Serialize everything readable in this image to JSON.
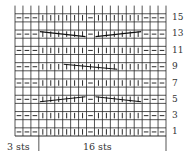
{
  "chart": {
    "columns": 19,
    "rows_shown": 16,
    "symbols": {
      "-": "purl",
      "|": "knit",
      ".": "blank (wrong-side row)"
    },
    "row_patterns": {
      "1": "---||||||-||||||---",
      "3": "---||||||-||||||---",
      "5": "---||||||-||||||---",
      "7": "---||||||-||||||---",
      "9": "---||||||||||||||---",
      "11": "---||||||-||||||---",
      "13": "---||||||-||||||---",
      "15": "---||||||-||||||---"
    },
    "cables": [
      {
        "row": 5,
        "from_col": 4,
        "to_col": 9,
        "direction": "rising"
      },
      {
        "row": 5,
        "from_col": 11,
        "to_col": 16,
        "direction": "falling"
      },
      {
        "row": 9,
        "from_col": 7,
        "to_col": 13,
        "direction": "falling"
      },
      {
        "row": 13,
        "from_col": 4,
        "to_col": 9,
        "direction": "falling"
      },
      {
        "row": 13,
        "from_col": 11,
        "to_col": 16,
        "direction": "rising"
      }
    ],
    "row_labels": [
      "15",
      "13",
      "11",
      "9",
      "7",
      "5",
      "3",
      "1"
    ],
    "repeat": {
      "edge_label": "3 sts",
      "repeat_label": "16 sts"
    }
  }
}
